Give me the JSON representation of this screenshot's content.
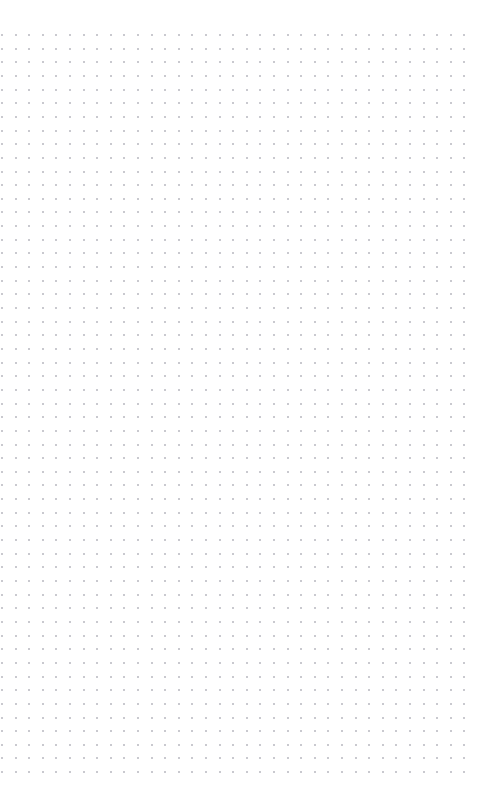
{
  "page": {
    "width": 499,
    "height": 794,
    "background_color": "#ffffff",
    "content_text": ""
  },
  "canvas": {
    "name": "dot-grid-canvas",
    "empty": true,
    "empty_state_text": "",
    "background_color": "#ffffff",
    "pattern": {
      "type": "dot-grid",
      "dot_color": "#c9c9cf",
      "dot_size_px": 2,
      "spacing_x_px": 13.6,
      "spacing_y_px": 13.65,
      "origin_x_px": 1,
      "origin_y_px": 34,
      "columns": 35,
      "rows": 55,
      "margin_top_px": 34,
      "margin_bottom_px": 23,
      "margin_left_px": 1,
      "margin_right_px": 24
    }
  }
}
